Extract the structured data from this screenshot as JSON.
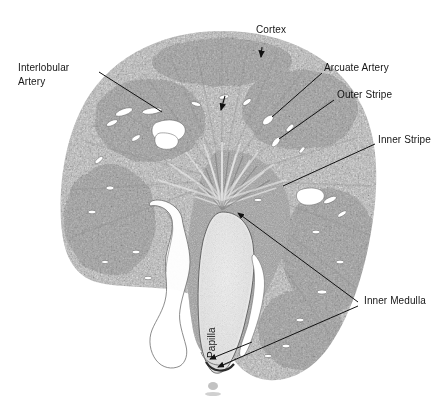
{
  "figure": {
    "kind": "histology-micrograph",
    "background_color": "#ffffff",
    "ink_color": "#161616"
  },
  "labels": [
    {
      "id": "cortex",
      "text": "Cortex",
      "x": 256,
      "y": 29,
      "rotated": false
    },
    {
      "id": "interlobular-l1",
      "text": "Interlobular",
      "x": 18,
      "y": 67,
      "rotated": false
    },
    {
      "id": "interlobular-l2",
      "text": "Artery",
      "x": 18,
      "y": 80,
      "rotated": false
    },
    {
      "id": "arcuate-artery",
      "text": "Arcuate Artery",
      "x": 324,
      "y": 67,
      "rotated": false
    },
    {
      "id": "outer-stripe",
      "text": "Outer Stripe",
      "x": 337,
      "y": 94,
      "rotated": false
    },
    {
      "id": "inner-stripe",
      "text": "Inner Stripe",
      "x": 378,
      "y": 139,
      "rotated": false
    },
    {
      "id": "inner-medulla",
      "text": "Inner Medulla",
      "x": 364,
      "y": 300,
      "rotated": false
    },
    {
      "id": "papilla",
      "text": "Papilla",
      "x": 205,
      "y": 357,
      "rotated": true
    }
  ],
  "leader_lines": [
    {
      "id": "cortex-arrow",
      "points": "262,49 261,58",
      "arrow": true
    },
    {
      "id": "interlobular-leader",
      "points": "98,72 160,111",
      "arrow": false
    },
    {
      "id": "arcuate-leader",
      "points": "322,74 267,118",
      "arrow": false
    },
    {
      "id": "outer-stripe-leader",
      "points": "334,100 276,139",
      "arrow": false
    },
    {
      "id": "inner-stripe-leader",
      "points": "375,144 281,185",
      "arrow": false
    },
    {
      "id": "inner-medulla-upper",
      "points": "360,303 236,214",
      "arrow": true
    },
    {
      "id": "inner-medulla-lower",
      "points": "360,306 216,369",
      "arrow": true
    },
    {
      "id": "papilla-leader",
      "points": "250,344 208,360",
      "arrow": true
    }
  ],
  "regions": [
    {
      "id": "cortex-region",
      "name": "Cortex"
    },
    {
      "id": "outer-stripe-region",
      "name": "Outer Stripe"
    },
    {
      "id": "inner-stripe-region",
      "name": "Inner Stripe"
    },
    {
      "id": "inner-medulla-region",
      "name": "Inner Medulla"
    },
    {
      "id": "papilla-region",
      "name": "Papilla"
    }
  ]
}
